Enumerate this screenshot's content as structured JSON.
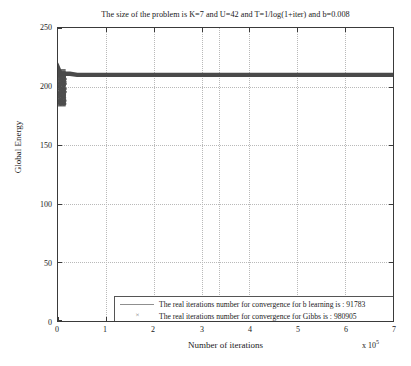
{
  "chart_data": {
    "type": "line",
    "title": "The size of the problem is K=7 and U=42 and T=1/log(1+iter) and b=0.008",
    "xlabel": "Number of iterations",
    "ylabel": "Global Energy",
    "x_exponent_prefix": "x 10",
    "x_exponent_power": "5",
    "xlim": [
      0,
      7
    ],
    "ylim": [
      0,
      250
    ],
    "xticks": [
      0,
      1,
      2,
      3,
      4,
      5,
      6,
      7
    ],
    "xtick_labels": [
      "0",
      "1",
      "2",
      "3",
      "4",
      "5",
      "6",
      "7"
    ],
    "yticks": [
      0,
      50,
      100,
      150,
      200,
      250
    ],
    "ytick_labels": [
      "0",
      "50",
      "100",
      "150",
      "200",
      "250"
    ],
    "grid": true,
    "legend_position": "lower center",
    "series": [
      {
        "name": "b-learning",
        "legend_label": "The real iterations number for convergence for b learning is : 91783",
        "marker": "line",
        "color": "#4a4a4a",
        "convergence_iterations": 91783,
        "x": [
          0.0,
          0.01,
          0.02,
          0.03,
          0.05,
          0.08,
          0.12,
          0.18,
          0.25,
          0.4,
          0.7,
          1.2,
          2.0,
          3.0,
          4.0,
          5.0,
          6.0,
          7.0
        ],
        "y": [
          208,
          212,
          214,
          213,
          212,
          211,
          211,
          211,
          211,
          210,
          210,
          210,
          210,
          210,
          210,
          210,
          210,
          210
        ]
      },
      {
        "name": "Gibbs",
        "legend_label": "The real iterations number for convergence for Gibbs is : 980905",
        "marker": "x",
        "color": "#5a5a5a",
        "convergence_iterations": 980905,
        "x": [
          0.0,
          0.01,
          0.02,
          0.03,
          0.04,
          0.05,
          0.06,
          0.07,
          0.08,
          0.09,
          0.1,
          0.11,
          0.12,
          0.13
        ],
        "y": [
          185,
          192,
          200,
          206,
          210,
          196,
          188,
          203,
          209,
          213,
          205,
          198,
          190,
          186
        ]
      }
    ],
    "annotations": [
      {
        "text": "dense vertical cluster of samples near origin spanning roughly y=183 to y=215"
      },
      {
        "text": "flat saturated trace at approximately y=210 across the full x range"
      }
    ]
  }
}
